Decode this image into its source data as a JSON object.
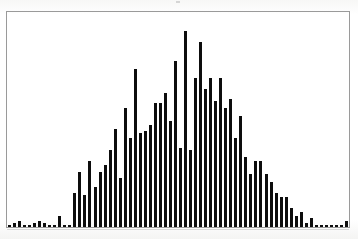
{
  "figure": {
    "title": "",
    "background_color": "#fdfdfc",
    "frame_color": "#9a9a9a",
    "bar_color": "#0d0d0d"
  },
  "chart_data": {
    "type": "bar",
    "title": "",
    "subtitle": "",
    "xlabel": "",
    "ylabel": "",
    "legend": [],
    "legend_position": "none",
    "grid": false,
    "axis_ticks_shown": false,
    "tick_labels_x": [],
    "tick_labels_y": [],
    "xlim": [
      0,
      68
    ],
    "ylim": [
      0,
      100
    ],
    "bar_count": 68,
    "categories": [
      "1",
      "2",
      "3",
      "4",
      "5",
      "6",
      "7",
      "8",
      "9",
      "10",
      "11",
      "12",
      "13",
      "14",
      "15",
      "16",
      "17",
      "18",
      "19",
      "20",
      "21",
      "22",
      "23",
      "24",
      "25",
      "26",
      "27",
      "28",
      "29",
      "30",
      "31",
      "32",
      "33",
      "34",
      "35",
      "36",
      "37",
      "38",
      "39",
      "40",
      "41",
      "42",
      "43",
      "44",
      "45",
      "46",
      "47",
      "48",
      "49",
      "50",
      "51",
      "52",
      "53",
      "54",
      "55",
      "56",
      "57",
      "58",
      "59",
      "60",
      "61",
      "62",
      "63",
      "64",
      "65",
      "66",
      "67",
      "68"
    ],
    "values": [
      1,
      2,
      3,
      1,
      1,
      2,
      3,
      2,
      1,
      1,
      5,
      1,
      1,
      16,
      26,
      15,
      31,
      19,
      26,
      29,
      36,
      46,
      23,
      56,
      42,
      74,
      44,
      45,
      48,
      58,
      58,
      63,
      50,
      78,
      37,
      92,
      36,
      70,
      87,
      65,
      70,
      59,
      70,
      56,
      60,
      42,
      52,
      33,
      25,
      31,
      31,
      25,
      21,
      16,
      14,
      14,
      9,
      5,
      7,
      2,
      4,
      1,
      1,
      1,
      1,
      1,
      1,
      3
    ]
  }
}
